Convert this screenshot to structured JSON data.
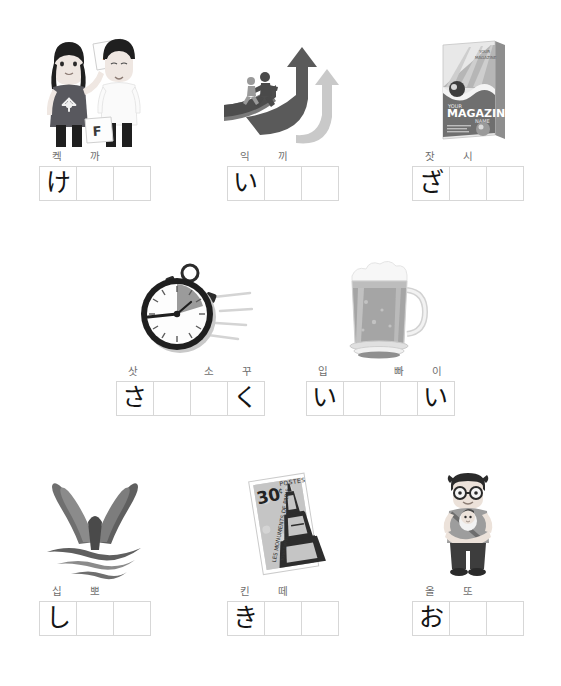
{
  "worksheet": {
    "title": "Hiragana picture writing worksheet",
    "box_border_color": "#d7d7d7",
    "label_color": "#6d6d6d",
    "kana_color": "#151515"
  },
  "rows": [
    {
      "items": [
        {
          "id": "item-1",
          "illustration": "students-with-a-plus-paper",
          "illustration_text": {
            "grade_a": "A+",
            "grade_f": "F"
          },
          "labels": [
            "켁",
            "까"
          ],
          "boxes": [
            "け",
            "",
            ""
          ]
        },
        {
          "id": "item-2",
          "illustration": "arrow-ramp-with-runners",
          "labels": [
            "익",
            "끼"
          ],
          "boxes": [
            "い",
            "",
            ""
          ]
        },
        {
          "id": "item-3",
          "illustration": "magazine-cover",
          "illustration_text": {
            "line1": "YOUR",
            "line2": "MAGAZINE",
            "line3": "NAME"
          },
          "labels": [
            "잣",
            "시"
          ],
          "boxes": [
            "ざ",
            "",
            ""
          ]
        }
      ]
    },
    {
      "items": [
        {
          "id": "item-4",
          "illustration": "stopwatch",
          "labels": [
            "삿",
            "소",
            "꾸"
          ],
          "boxes": [
            "さ",
            "",
            "",
            "く"
          ]
        },
        {
          "id": "item-5",
          "illustration": "beer-mug",
          "labels": [
            "입",
            "빠",
            "이"
          ],
          "boxes": [
            "い",
            "",
            "",
            "い"
          ]
        }
      ]
    },
    {
      "items": [
        {
          "id": "item-6",
          "illustration": "whale-tail",
          "labels": [
            "십",
            "뽀"
          ],
          "boxes": [
            "し",
            "",
            ""
          ]
        },
        {
          "id": "item-7",
          "illustration": "postage-stamp-eiffel-tower",
          "illustration_text": {
            "value": "30",
            "currency": "¢",
            "country": "POSTES"
          },
          "labels": [
            "킨",
            "떼"
          ],
          "boxes": [
            "き",
            "",
            ""
          ]
        },
        {
          "id": "item-8",
          "illustration": "man-holding-baby",
          "labels": [
            "올",
            "또"
          ],
          "boxes": [
            "お",
            "",
            ""
          ]
        }
      ]
    }
  ]
}
